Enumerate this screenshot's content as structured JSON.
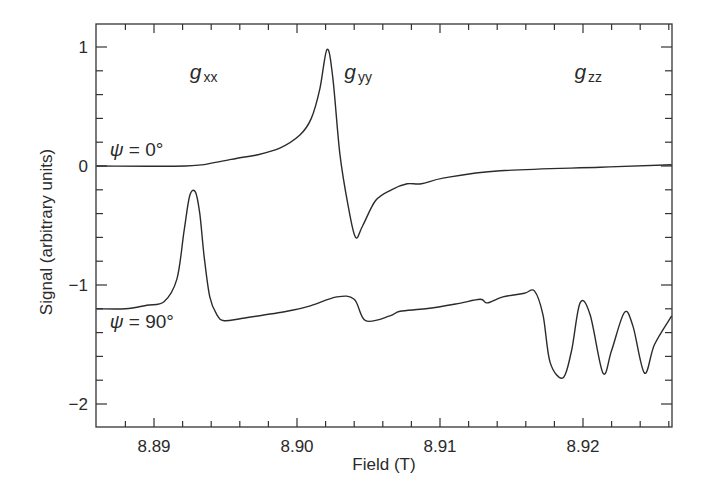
{
  "chart_data": {
    "type": "line",
    "title": "",
    "xlabel": "Field (T)",
    "ylabel": "Signal (arbitrary units)",
    "xlim": [
      8.886,
      8.9262
    ],
    "ylim": [
      -2.2,
      1.2
    ],
    "x_ticks": [
      8.89,
      8.9,
      8.91,
      8.92
    ],
    "x_tick_labels": [
      "8.89",
      "8.90",
      "8.91",
      "8.92"
    ],
    "x_minor_step": 0.002,
    "y_ticks": [
      1,
      0,
      -1,
      -2
    ],
    "y_tick_labels": [
      "1",
      "0",
      "−1",
      "−2"
    ],
    "y_minor_step": 0.2,
    "grid": false,
    "legend": null,
    "annotations": [
      {
        "base": "g",
        "sub": "xx",
        "x": 8.8925,
        "y": 0.73
      },
      {
        "base": "g",
        "sub": "yy",
        "x": 8.9033,
        "y": 0.73
      },
      {
        "base": "g",
        "sub": "zz",
        "x": 8.9194,
        "y": 0.73
      }
    ],
    "series": [
      {
        "name": "ψ = 0°",
        "label_pos": {
          "x": 8.8869,
          "y": 0.08
        },
        "x": [
          8.886,
          8.8922,
          8.8943,
          8.896,
          8.8971,
          8.8988,
          8.9002,
          8.901,
          8.9016,
          8.9021,
          8.9025,
          8.903,
          8.9036,
          8.9041,
          8.9046,
          8.9055,
          8.9066,
          8.9077,
          8.9087,
          8.9103,
          8.9142,
          8.9212,
          8.9262
        ],
        "values": [
          0,
          0,
          0.03,
          0.07,
          0.09,
          0.15,
          0.26,
          0.4,
          0.65,
          0.98,
          0.75,
          0.1,
          -0.35,
          -0.6,
          -0.5,
          -0.29,
          -0.2,
          -0.15,
          -0.15,
          -0.1,
          -0.04,
          -0.01,
          0.01
        ]
      },
      {
        "name": "ψ = 90°",
        "label_pos": {
          "x": 8.8869,
          "y": -1.36
        },
        "x": [
          8.886,
          8.888,
          8.8895,
          8.8907,
          8.8916,
          8.8921,
          8.8925,
          8.8929,
          8.8932,
          8.8935,
          8.8939,
          8.8944,
          8.8949,
          8.8962,
          8.8993,
          8.9008,
          8.9028,
          8.904,
          8.9048,
          8.9065,
          8.9072,
          8.909,
          8.9111,
          8.9128,
          8.9133,
          8.9144,
          8.9159,
          8.9166,
          8.9172,
          8.9177,
          8.9186,
          8.9192,
          8.9198,
          8.9205,
          8.9214,
          8.922,
          8.9229,
          8.9235,
          8.9243,
          8.925,
          8.9262
        ],
        "values": [
          -1.2,
          -1.2,
          -1.17,
          -1.14,
          -0.95,
          -0.55,
          -0.25,
          -0.22,
          -0.4,
          -0.75,
          -1.1,
          -1.25,
          -1.3,
          -1.28,
          -1.22,
          -1.18,
          -1.1,
          -1.12,
          -1.3,
          -1.26,
          -1.22,
          -1.2,
          -1.16,
          -1.12,
          -1.15,
          -1.1,
          -1.07,
          -1.05,
          -1.25,
          -1.65,
          -1.78,
          -1.55,
          -1.15,
          -1.25,
          -1.74,
          -1.55,
          -1.23,
          -1.35,
          -1.74,
          -1.5,
          -1.26
        ]
      }
    ]
  }
}
